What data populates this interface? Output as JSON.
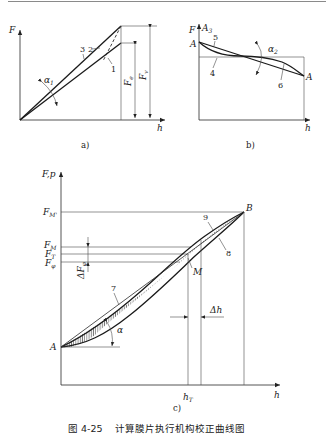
{
  "figure": {
    "number": "图 4-25",
    "caption": "计算膜片执行机构校正曲线图"
  },
  "panels": {
    "a": {
      "label": "a)",
      "axis_y": "F",
      "axis_x": "h",
      "curve_labels": [
        "1",
        "2",
        "3"
      ],
      "angle": "α",
      "angle_sub": "1",
      "force_e": "F",
      "force_e_sub": "e",
      "force_v": "F",
      "force_v_sub": "v"
    },
    "b": {
      "label": "b)",
      "axis_y": "F",
      "axis_y2": "A",
      "axis_y2_sub": "3",
      "axis_x": "h",
      "point_left": "A",
      "point_right": "A",
      "curve_labels": [
        "4",
        "5",
        "6"
      ],
      "angle": "α",
      "angle_sub": "2"
    },
    "c": {
      "label": "c)",
      "axis_y": "F,p",
      "axis_x": "h",
      "ticks_y": [
        {
          "main": "F",
          "sub": "M'"
        },
        {
          "main": "F",
          "sub": "M"
        },
        {
          "main": "F",
          "sub": "T"
        },
        {
          "main": "F",
          "sub": "φ"
        }
      ],
      "delta_f": "ΔF",
      "delta_f_sub": "φ",
      "point_A": "A",
      "point_B": "B",
      "point_M": "M",
      "curve_labels": [
        "7",
        "8",
        "9"
      ],
      "angle": "α",
      "delta_h": "Δh",
      "h_tick": "h",
      "h_tick_sub": "T"
    }
  }
}
